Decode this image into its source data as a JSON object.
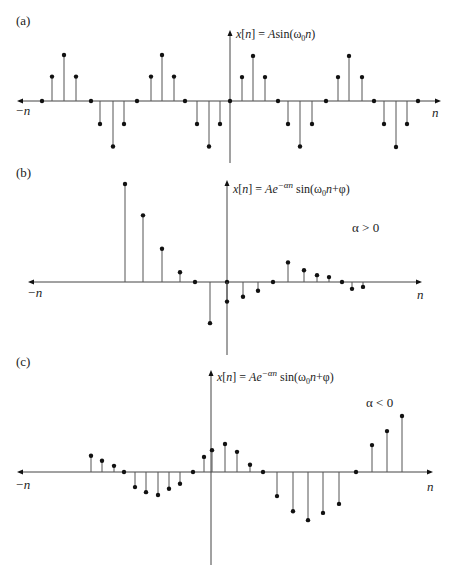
{
  "figure": {
    "background": "#ffffff",
    "stem_color": "#555555",
    "marker_color": "#111111",
    "axis_color": "#444444"
  },
  "chart_data": [
    {
      "type": "stem",
      "panel_label": "(a)",
      "title": "x[n] = A sin(ω0 n)",
      "formula_parts": {
        "lhs": "x[n] = ",
        "amp": "A",
        "fn": "sin(ω",
        "sub": "0",
        "arg": "n)"
      },
      "xlabel_left": "−n",
      "xlabel_right": "n",
      "condition": "",
      "layout": {
        "axis_y": 101,
        "axis_x0": 17,
        "axis_x1": 441,
        "vaxis_x": 230,
        "vaxis_y0": 30,
        "vaxis_y1": 163,
        "scale": 46
      },
      "description": "Periodic discrete sinusoid, period 8 samples, pattern 0, +0.5, +1, +0.5, 0, -0.5, -1, -0.5",
      "points": [
        {
          "x": 42,
          "v": 0
        },
        {
          "x": 52,
          "v": 0.53
        },
        {
          "x": 64,
          "v": 1.0
        },
        {
          "x": 76,
          "v": 0.53
        },
        {
          "x": 91,
          "v": 0
        },
        {
          "x": 100,
          "v": -0.5
        },
        {
          "x": 113,
          "v": -0.99
        },
        {
          "x": 124,
          "v": -0.5
        },
        {
          "x": 137,
          "v": 0
        },
        {
          "x": 151,
          "v": 0.53
        },
        {
          "x": 162,
          "v": 1.0
        },
        {
          "x": 174,
          "v": 0.53
        },
        {
          "x": 185,
          "v": 0
        },
        {
          "x": 197,
          "v": -0.5
        },
        {
          "x": 209,
          "v": -0.99
        },
        {
          "x": 220,
          "v": -0.5
        },
        {
          "x": 230,
          "v": 0
        },
        {
          "x": 242,
          "v": 0.52
        },
        {
          "x": 253,
          "v": 0.98
        },
        {
          "x": 265,
          "v": 0.52
        },
        {
          "x": 278,
          "v": 0
        },
        {
          "x": 288,
          "v": -0.5
        },
        {
          "x": 300,
          "v": -0.99
        },
        {
          "x": 312,
          "v": -0.5
        },
        {
          "x": 326,
          "v": 0
        },
        {
          "x": 338,
          "v": 0.52
        },
        {
          "x": 349,
          "v": 0.98
        },
        {
          "x": 362,
          "v": 0.52
        },
        {
          "x": 374,
          "v": 0
        },
        {
          "x": 384,
          "v": -0.5
        },
        {
          "x": 396,
          "v": -1.0
        },
        {
          "x": 407,
          "v": -0.5
        },
        {
          "x": 418,
          "v": 0
        }
      ]
    },
    {
      "type": "stem",
      "panel_label": "(b)",
      "title": "x[n] = A e^(−αn) sin(ω0 n + φ)",
      "formula_parts": {
        "lhs": "x[n] = ",
        "amp": "Ae",
        "exp": "−αn",
        "fn": " sin(ω",
        "sub": "0",
        "arg": "n+φ)"
      },
      "xlabel_left": "−n",
      "xlabel_right": "n",
      "condition": "α > 0",
      "layout": {
        "axis_y": 282,
        "axis_x0": 28,
        "axis_x1": 422,
        "vaxis_x": 227,
        "vaxis_y0": 180,
        "vaxis_y1": 355,
        "scale": 98
      },
      "description": "Exponentially decaying discrete sinusoid (α > 0)",
      "points": [
        {
          "x": 125,
          "v": 1.0
        },
        {
          "x": 143,
          "v": 0.68
        },
        {
          "x": 162,
          "v": 0.34
        },
        {
          "x": 180,
          "v": 0.1
        },
        {
          "x": 195,
          "v": 0
        },
        {
          "x": 210,
          "v": -0.42
        },
        {
          "x": 227,
          "v": 0
        },
        {
          "x": 227,
          "v": -0.2
        },
        {
          "x": 243,
          "v": -0.15
        },
        {
          "x": 258,
          "v": -0.09
        },
        {
          "x": 273,
          "v": 0
        },
        {
          "x": 288,
          "v": 0.2
        },
        {
          "x": 304,
          "v": 0.12
        },
        {
          "x": 317,
          "v": 0.07
        },
        {
          "x": 329,
          "v": 0.05
        },
        {
          "x": 342,
          "v": 0
        },
        {
          "x": 352,
          "v": -0.07
        },
        {
          "x": 363,
          "v": -0.05
        }
      ]
    },
    {
      "type": "stem",
      "panel_label": "(c)",
      "title": "x[n] = A e^(−αn) sin(ω0 n + φ)",
      "formula_parts": {
        "lhs": "x[n] = ",
        "amp": "Ae",
        "exp": "−αn",
        "fn": " sin(ω",
        "sub": "0",
        "arg": "n+φ)"
      },
      "xlabel_left": "−n",
      "xlabel_right": "n",
      "condition": "α < 0",
      "layout": {
        "axis_y": 472,
        "axis_x0": 17,
        "axis_x1": 433,
        "vaxis_x": 211,
        "vaxis_y0": 370,
        "vaxis_y1": 565,
        "scale": 56
      },
      "description": "Exponentially growing discrete sinusoid (α < 0)",
      "points": [
        {
          "x": 91,
          "v": 0.29
        },
        {
          "x": 102,
          "v": 0.2
        },
        {
          "x": 114,
          "v": 0.11
        },
        {
          "x": 124,
          "v": 0
        },
        {
          "x": 135,
          "v": -0.27
        },
        {
          "x": 146,
          "v": -0.36
        },
        {
          "x": 158,
          "v": -0.41
        },
        {
          "x": 169,
          "v": -0.3
        },
        {
          "x": 180,
          "v": -0.21
        },
        {
          "x": 193,
          "v": 0
        },
        {
          "x": 204,
          "v": 0.27
        },
        {
          "x": 212,
          "v": 0.39
        },
        {
          "x": 225,
          "v": 0.5
        },
        {
          "x": 237,
          "v": 0.36
        },
        {
          "x": 250,
          "v": 0.13
        },
        {
          "x": 263,
          "v": 0
        },
        {
          "x": 277,
          "v": -0.43
        },
        {
          "x": 293,
          "v": -0.7
        },
        {
          "x": 308,
          "v": -0.86
        },
        {
          "x": 323,
          "v": -0.73
        },
        {
          "x": 339,
          "v": -0.57
        },
        {
          "x": 356,
          "v": 0
        },
        {
          "x": 372,
          "v": 0.48
        },
        {
          "x": 387,
          "v": 0.73
        },
        {
          "x": 402,
          "v": 1.0
        }
      ]
    }
  ],
  "labels": {
    "a": {
      "panel": "(a)",
      "left": "−n",
      "right": "n",
      "condition": ""
    },
    "b": {
      "panel": "(b)",
      "left": "−n",
      "right": "n",
      "condition": "α > 0"
    },
    "c": {
      "panel": "(c)",
      "left": "−n",
      "right": "n",
      "condition": "α < 0"
    }
  }
}
